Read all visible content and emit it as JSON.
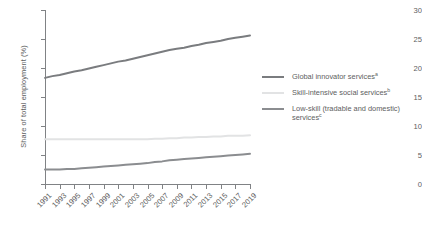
{
  "chart_data": {
    "type": "line",
    "title": "",
    "xlabel": "",
    "ylabel": "Share of total employment (%)",
    "ylim": [
      0,
      30
    ],
    "yticks": [
      0,
      5,
      10,
      15,
      20,
      25,
      30
    ],
    "grid": false,
    "legend_position": "right",
    "categories": [
      1991,
      1992,
      1993,
      1994,
      1995,
      1996,
      1997,
      1998,
      1999,
      2000,
      2001,
      2002,
      2003,
      2004,
      2005,
      2006,
      2007,
      2008,
      2009,
      2010,
      2011,
      2012,
      2013,
      2014,
      2015,
      2016,
      2017,
      2018,
      2019
    ],
    "xtick_labels": [
      "1991",
      "1993",
      "1995",
      "1997",
      "1999",
      "2001",
      "2003",
      "2005",
      "2007",
      "2009",
      "2011",
      "2013",
      "2015",
      "2017",
      "2019"
    ],
    "series": [
      {
        "name": "Global innovator services",
        "footnote": "a",
        "color": "#7a7c7f",
        "values": [
          18.3,
          18.6,
          18.8,
          19.1,
          19.4,
          19.6,
          19.9,
          20.2,
          20.5,
          20.8,
          21.1,
          21.3,
          21.6,
          21.9,
          22.2,
          22.5,
          22.8,
          23.1,
          23.3,
          23.5,
          23.8,
          24.0,
          24.3,
          24.5,
          24.7,
          25.0,
          25.2,
          25.4,
          25.6
        ]
      },
      {
        "name": "Skill-intensive social services",
        "footnote": "b",
        "color": "#e2e3e4",
        "values": [
          7.7,
          7.7,
          7.7,
          7.7,
          7.7,
          7.7,
          7.7,
          7.7,
          7.7,
          7.7,
          7.7,
          7.7,
          7.7,
          7.7,
          7.7,
          7.8,
          7.8,
          7.9,
          7.9,
          8.0,
          8.0,
          8.1,
          8.1,
          8.2,
          8.2,
          8.3,
          8.3,
          8.3,
          8.4
        ]
      },
      {
        "name": "Low-skill (tradable and domestic) services",
        "footnote": "c",
        "color": "#8b8d90",
        "values": [
          2.5,
          2.5,
          2.5,
          2.6,
          2.6,
          2.7,
          2.8,
          2.9,
          3.0,
          3.1,
          3.2,
          3.3,
          3.4,
          3.5,
          3.6,
          3.8,
          3.9,
          4.1,
          4.2,
          4.3,
          4.4,
          4.5,
          4.6,
          4.7,
          4.8,
          4.9,
          5.0,
          5.1,
          5.2
        ]
      }
    ]
  },
  "legend": {
    "items": [
      {
        "label": "Global innovator services",
        "footnote": "a"
      },
      {
        "label": "Skill-intensive social services",
        "footnote": "b"
      },
      {
        "label": "Low-skill (tradable and domestic) services",
        "footnote": "c"
      }
    ]
  },
  "axis": {
    "y_title": "Share of total employment (%)"
  }
}
